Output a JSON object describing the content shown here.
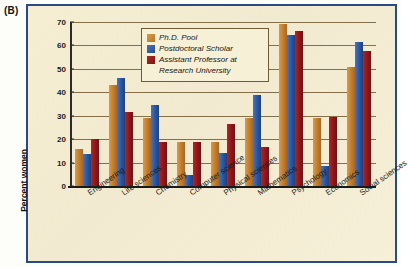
{
  "panel_label": "(B)",
  "chart_data": {
    "type": "bar",
    "title": "",
    "xlabel": "",
    "ylabel": "Percent women",
    "ylim": [
      0,
      70
    ],
    "yticks": [
      0,
      10,
      20,
      30,
      40,
      50,
      60,
      70
    ],
    "grid": true,
    "legend_position": "top-center",
    "categories": [
      "Engineering",
      "Life sciences",
      "Chemistry",
      "Computer science",
      "Physical sciences",
      "Mathematics",
      "Psychology",
      "Economics",
      "Social sciences"
    ],
    "series": [
      {
        "name": "Ph.D. Pool",
        "color": "#c07c2c",
        "values": [
          16,
          43,
          29,
          19,
          19,
          29,
          69,
          29,
          51
        ]
      },
      {
        "name": "Postdoctoral Scholar",
        "color": "#2a549c",
        "values": [
          13.5,
          46,
          34.5,
          4.5,
          14,
          39,
          64.5,
          8.5,
          61.5
        ]
      },
      {
        "name": "Assistant Professor at Research University",
        "color": "#8e1517",
        "values": [
          20,
          31.5,
          19,
          18.8,
          26.5,
          16.5,
          66,
          29.5,
          57.5
        ]
      }
    ]
  },
  "legend": {
    "entries": [
      "Ph.D. Pool",
      "Postdoctoral Scholar",
      "Assistant Professor at",
      "Research University"
    ]
  },
  "colors": {
    "frame": "#2a4a86",
    "panel_bg": "#f4edcf",
    "series_phd": "#c07c2c",
    "series_postdoc": "#2a549c",
    "series_assistant": "#8e1517",
    "gridline": "#6e5a33"
  }
}
